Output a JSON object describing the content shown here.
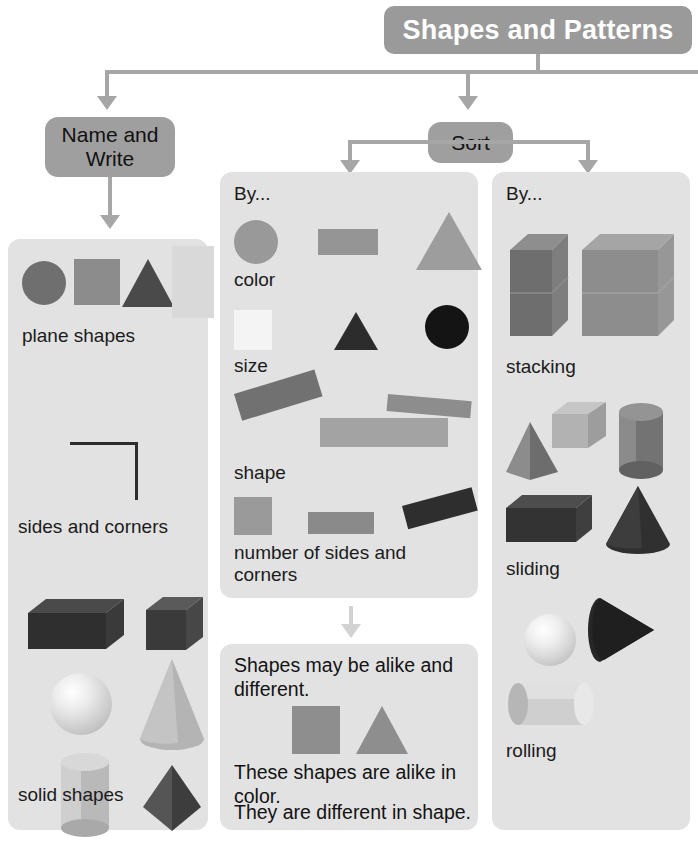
{
  "title": {
    "text": "Shapes and Patterns"
  },
  "nodes": {
    "name_write": "Name and Write",
    "sort": "Sort"
  },
  "panels": {
    "plane_solid": {
      "labels": {
        "plane_shapes": "plane shapes",
        "sides_and_corners": "sides and corners",
        "solid_shapes": "solid shapes"
      },
      "plane_shape_items": [
        "circle",
        "square",
        "triangle",
        "rectangle"
      ],
      "solid_shape_items": [
        "rectangular-prism",
        "cube",
        "sphere",
        "cone",
        "cylinder",
        "pyramid"
      ]
    },
    "sort_by": {
      "heading": "By...",
      "categories": [
        "color",
        "size",
        "shape",
        "number of sides and corners"
      ],
      "color_row_items": [
        "circle",
        "rectangle",
        "triangle"
      ],
      "size_row_items": [
        "square",
        "triangle",
        "circle"
      ],
      "shape_row_items": [
        "rotated-rectangle",
        "thin-rectangle",
        "wide-rectangle"
      ],
      "sides_row_items": [
        "square",
        "rectangle",
        "rotated-rectangle"
      ]
    },
    "alike": {
      "line1": "Shapes may be alike and different.",
      "line2": "These shapes are alike in color.",
      "line3": "They are different in shape.",
      "items": [
        "square",
        "triangle"
      ]
    },
    "move_by": {
      "heading": "By...",
      "categories": [
        "stacking",
        "sliding",
        "rolling"
      ],
      "stacking_items": [
        "rectangular-prism",
        "cube"
      ],
      "sliding_items": [
        "pyramid",
        "cube",
        "cylinder",
        "rectangular-prism",
        "cone"
      ],
      "rolling_items": [
        "sphere",
        "cone",
        "cylinder"
      ]
    }
  },
  "colors": {
    "banner": "#9a9a9a",
    "node": "#9f9f9f",
    "panel": "#e2e2e2",
    "connector": "#a6a6a6",
    "connector_pale": "#d2d2d2",
    "shape_mid_gray": "#8c8c8c",
    "shape_dark_gray": "#5e5e5e",
    "shape_near_black": "#2a2a2a",
    "shape_light_gray": "#cfcfcf",
    "shape_pale": "#f2f2f2"
  }
}
